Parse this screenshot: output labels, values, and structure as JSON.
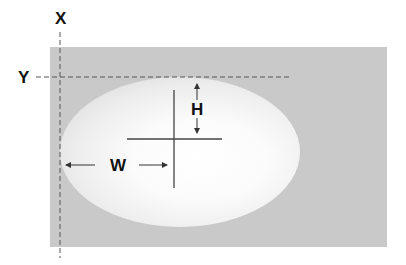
{
  "diagram": {
    "labels": {
      "x_axis": "X",
      "y_axis": "Y",
      "height": "H",
      "width": "W"
    },
    "colors": {
      "background": "#ffffff",
      "panel": "#c9c9c9",
      "glow_center": "#ffffff",
      "lines": "#444444",
      "text": "#111111"
    },
    "elements": [
      {
        "name": "panel",
        "shape": "rectangle"
      },
      {
        "name": "glow",
        "shape": "ellipse",
        "fill": "radial-gradient white to gray"
      },
      {
        "name": "x-guide",
        "shape": "dashed vertical line"
      },
      {
        "name": "y-guide",
        "shape": "dashed horizontal line"
      },
      {
        "name": "crosshair",
        "shape": "cross"
      },
      {
        "name": "height-arrows",
        "shape": "double vertical arrows"
      },
      {
        "name": "width-arrows",
        "shape": "double horizontal arrows"
      }
    ]
  }
}
